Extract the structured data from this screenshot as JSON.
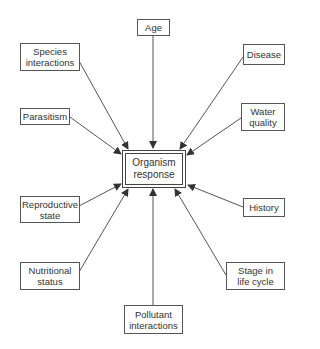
{
  "diagram": {
    "center": {
      "label": "Organism\nresponse"
    },
    "factors": [
      {
        "id": "age",
        "label": "Age"
      },
      {
        "id": "species-interactions",
        "label": "Species\ninteractions"
      },
      {
        "id": "disease",
        "label": "Disease"
      },
      {
        "id": "parasitism",
        "label": "Parasitism"
      },
      {
        "id": "water-quality",
        "label": "Water\nquality"
      },
      {
        "id": "reproductive-state",
        "label": "Reproductive\nstate"
      },
      {
        "id": "history",
        "label": "History"
      },
      {
        "id": "nutritional-status",
        "label": "Nutritional\nstatus"
      },
      {
        "id": "stage-in-life-cycle",
        "label": "Stage in\nlife cycle"
      },
      {
        "id": "pollutant-interactions",
        "label": "Pollutant\ninteractions"
      }
    ],
    "edges_direction": "factor-to-center",
    "colors": {
      "line": "#555555",
      "border": "#555555",
      "text": "#333333",
      "background": "#ffffff"
    }
  }
}
